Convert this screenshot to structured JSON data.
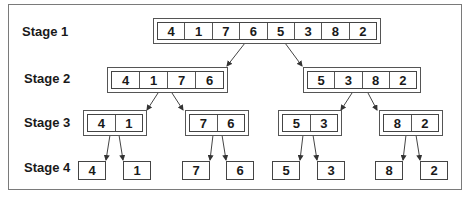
{
  "diagram": {
    "type": "merge-sort-divide-tree",
    "stages": [
      {
        "label": "Stage 1",
        "arrays": [
          [
            "4",
            "1",
            "7",
            "6",
            "5",
            "3",
            "8",
            "2"
          ]
        ]
      },
      {
        "label": "Stage 2",
        "arrays": [
          [
            "4",
            "1",
            "7",
            "6"
          ],
          [
            "5",
            "3",
            "8",
            "2"
          ]
        ]
      },
      {
        "label": "Stage 3",
        "arrays": [
          [
            "4",
            "1"
          ],
          [
            "7",
            "6"
          ],
          [
            "5",
            "3"
          ],
          [
            "8",
            "2"
          ]
        ]
      },
      {
        "label": "Stage 4",
        "arrays": [
          [
            "4"
          ],
          [
            "1"
          ],
          [
            "7"
          ],
          [
            "6"
          ],
          [
            "5"
          ],
          [
            "3"
          ],
          [
            "8"
          ],
          [
            "2"
          ]
        ]
      }
    ]
  }
}
